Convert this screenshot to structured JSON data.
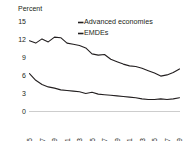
{
  "chart_data": {
    "type": "line",
    "title": "",
    "subtitle": "",
    "ylabel": "Percent",
    "xlabel": "",
    "ylim": [
      0,
      15
    ],
    "yticks": [
      0,
      3,
      6,
      9,
      12,
      15
    ],
    "ytick_labels": [
      "0",
      "3",
      "6",
      "9",
      "12",
      "15"
    ],
    "grid": false,
    "legend_position": "top-right",
    "x": [
      1995,
      1996,
      1997,
      1998,
      1999,
      2000,
      2001,
      2002,
      2003,
      2004,
      2005,
      2006,
      2007,
      2008,
      2009,
      2010,
      2011,
      2012,
      2013,
      2014,
      2015,
      2016,
      2017,
      2018,
      2019
    ],
    "xtick_labels": [
      "1995",
      "1997",
      "1999",
      "2001",
      "2003",
      "2005",
      "2007",
      "2009",
      "2011",
      "2013",
      "2015",
      "2017",
      "2019"
    ],
    "xticks": [
      1995,
      1997,
      1999,
      2001,
      2003,
      2005,
      2007,
      2009,
      2011,
      2013,
      2015,
      2017,
      2019
    ],
    "series": [
      {
        "name": "EMDEs",
        "color": "#231f20",
        "values": [
          11.8,
          11.4,
          12.1,
          11.6,
          12.4,
          12.3,
          11.4,
          11.2,
          11.0,
          10.6,
          9.6,
          9.4,
          9.5,
          8.7,
          8.3,
          7.9,
          7.6,
          7.5,
          7.2,
          6.8,
          6.4,
          5.9,
          6.1,
          6.5,
          7.1
        ]
      },
      {
        "name": "Advanced economies",
        "color": "#231f20",
        "values": [
          6.3,
          5.2,
          4.5,
          4.1,
          3.9,
          3.6,
          3.5,
          3.4,
          3.3,
          3.0,
          3.2,
          2.9,
          2.8,
          2.7,
          2.6,
          2.5,
          2.4,
          2.3,
          2.1,
          2.0,
          2.0,
          2.1,
          2.0,
          2.1,
          2.3
        ]
      }
    ],
    "legend_entries": [
      {
        "label": "Advanced economies",
        "color": "#231f20"
      },
      {
        "label": "EMDEs",
        "color": "#231f20"
      }
    ]
  },
  "colors": {
    "line": "#231f20",
    "baseline": "#b8b8b8",
    "text": "#231f20",
    "background": "#ffffff"
  }
}
